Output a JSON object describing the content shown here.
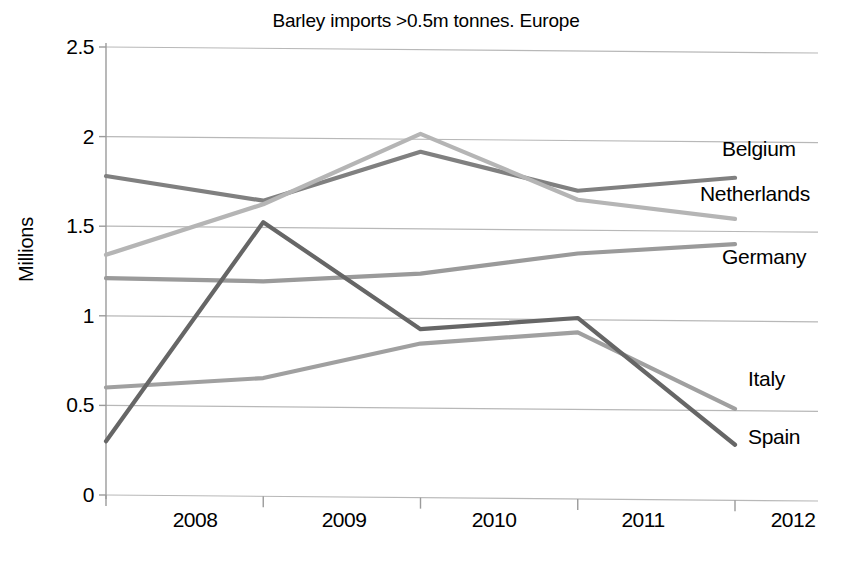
{
  "chart_data": {
    "type": "line",
    "title": "Barley imports >0.5m tonnes. Europe",
    "xlabel": "",
    "ylabel": "Millions",
    "x": [
      2008,
      2009,
      2010,
      2011,
      2012
    ],
    "xtick_labels": [
      "2008",
      "2009",
      "2010",
      "2011",
      "2012"
    ],
    "ytick_labels": [
      "0",
      "0.5",
      "1",
      "1.5",
      "2",
      "2.5"
    ],
    "ytick_values": [
      0,
      0.5,
      1,
      1.5,
      2,
      2.5
    ],
    "ylim": [
      0,
      2.5
    ],
    "xlim": [
      2008,
      2012
    ],
    "grid": "horizontal",
    "legend_position": "right-inline-labels",
    "series": [
      {
        "name": "Belgium",
        "color": "#808080",
        "values": [
          1.78,
          1.65,
          1.93,
          1.72,
          1.8
        ],
        "label_value": 1.8
      },
      {
        "name": "Netherlands",
        "color": "#b5b5b5",
        "values": [
          1.34,
          1.63,
          2.03,
          1.67,
          1.57
        ],
        "label_value": 1.57
      },
      {
        "name": "Germany",
        "color": "#9a9a9a",
        "values": [
          1.21,
          1.2,
          1.25,
          1.37,
          1.43
        ],
        "label_value": 1.43
      },
      {
        "name": "Italy",
        "color": "#a0a0a0",
        "values": [
          0.6,
          0.66,
          0.86,
          0.93,
          0.51
        ],
        "label_value": 0.51
      },
      {
        "name": "Spain",
        "color": "#666666",
        "values": [
          0.3,
          1.53,
          0.94,
          1.01,
          0.31
        ],
        "label_value": 0.31
      }
    ],
    "axis_color": "#9b9b9b",
    "grid_color": "#b8b8b8"
  },
  "labels": {
    "belgium": "Belgium",
    "netherlands": "Netherlands",
    "germany": "Germany",
    "italy": "Italy",
    "spain": "Spain"
  }
}
